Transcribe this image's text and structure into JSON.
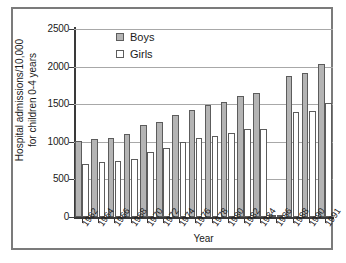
{
  "chart_data": {
    "type": "bar",
    "title": "",
    "xlabel": "Year",
    "ylabel": "Hospital admissions/10,000\nfor children 0-4 years",
    "categories": [
      "1962",
      "1964",
      "1966",
      "1968",
      "1970",
      "1972",
      "1974",
      "1976",
      "1978",
      "1980",
      "1982",
      "1984",
      "1986",
      "1988",
      "1990",
      "1991"
    ],
    "series": [
      {
        "name": "Boys",
        "color": "#b4b4b4",
        "values": [
          1005,
          1035,
          1055,
          1110,
          1225,
          1270,
          1355,
          1420,
          1485,
          1535,
          1610,
          1655,
          30,
          1880,
          1920,
          2030
        ]
      },
      {
        "name": "Girls",
        "color": "#ffffff",
        "values": [
          700,
          730,
          745,
          775,
          865,
          920,
          1000,
          1055,
          1080,
          1120,
          1175,
          1175,
          25,
          1390,
          1415,
          1520
        ]
      }
    ],
    "ylim": [
      0,
      2500
    ],
    "yticks": [
      0,
      500,
      1000,
      1500,
      2000,
      2500
    ],
    "ytick_labels": [
      "0",
      "500",
      "1000",
      "1500",
      "2000",
      "2500"
    ],
    "grid": true,
    "legend_position": "top-left"
  },
  "legend": {
    "entries": [
      {
        "label": "Boys"
      },
      {
        "label": "Girls"
      }
    ]
  },
  "axes": {
    "y_title": "Hospital admissions/10,000\nfor children 0-4 years",
    "x_title": "Year"
  }
}
